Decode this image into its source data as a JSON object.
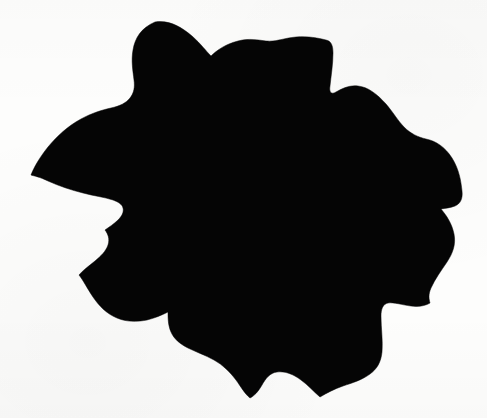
{
  "image": {
    "kind": "scanned-silhouette",
    "subject_name": "lobed leaf silhouette",
    "width": 487,
    "height": 418,
    "background_color": "#fdfdfc",
    "subject_color": "#050505",
    "caption": "",
    "title": "",
    "has_text": false,
    "text_elements": [],
    "palette": {
      "paper": "#fdfdfc",
      "ink": "#050505",
      "grain": "rgba(0,0,0,0.02)"
    },
    "geometry": {
      "viewbox": "0 0 487 418",
      "bounding_box": {
        "x_min": 31,
        "y_min": 22,
        "x_max": 462,
        "y_max": 398
      },
      "lobe_count": 9,
      "outline_path": "M155,22 C169,20 180,26 192,36 C201,44 206,51 211,56 C217,50 226,44 238,41 C249,38 258,40 266,41 C276,42 284,38 296,37 C308,36 318,38 326,40 C331,41 333,45 333,53 C333,64 331,76 330,86 C329,92 331,95 336,92 C343,88 350,85 358,86 C368,87 377,94 386,104 C393,112 398,121 404,127 C411,134 418,137 426,139 C436,141 445,147 452,158 C459,169 461,181 462,191 C463,199 460,204 455,206 C450,208 446,208 441,209 C447,216 452,224 454,234 C456,244 453,253 447,262 C441,271 435,279 431,288 C428,295 429,299 430,303 C425,306 418,307 411,306 C402,305 394,302 388,303 C383,304 381,309 381,316 C381,328 383,341 382,352 C381,362 377,369 370,374 C362,380 352,383 343,386 C334,389 327,393 320,397 C314,392 308,385 301,380 C293,374 285,371 277,372 C270,373 266,378 262,385 C258,392 254,396 250,398 C245,394 241,387 236,380 C230,372 223,365 214,360 C205,355 196,352 188,348 C180,344 174,339 171,332 C168,325 168,318 168,312 C162,315 155,318 147,320 C137,322 126,322 117,318 C107,314 99,306 93,297 C87,288 83,280 79,275 C83,270 89,266 95,261 C101,256 106,251 108,245 C110,239 108,234 105,230 C109,227 114,224 118,220 C122,216 124,212 123,208 C122,204 118,202 113,200 C104,197 94,196 83,193 C71,190 59,186 48,181 C40,177 34,176 31,175 C34,167 40,157 48,147 C57,136 68,126 81,119 C92,113 102,110 111,108 C120,106 126,103 130,98 C134,93 135,87 134,80 C133,71 131,61 133,50 C135,38 141,28 155,22 Z"
    },
    "tool": {
      "name": "",
      "labels": []
    }
  }
}
